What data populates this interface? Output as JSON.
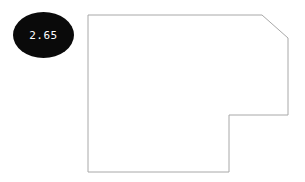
{
  "diagram": {
    "background_color": "#ffffff",
    "outline_color": "#a8a8a8",
    "callout": {
      "label": "2.65",
      "fill_color": "#0a0a0a",
      "text_color": "#ffffff",
      "center_x": 43.5,
      "center_y": 35,
      "radius_x": 30.5,
      "radius_y": 23
    },
    "shape": {
      "name": "notched-chamfered-polygon",
      "points": "88,15 262,15 288,38 288,115 229,115 229,172 88,172"
    }
  }
}
